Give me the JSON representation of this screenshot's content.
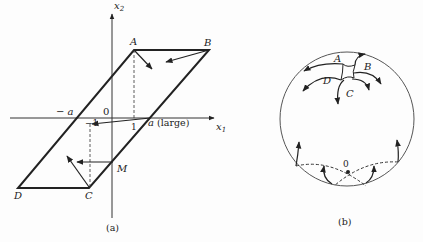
{
  "figure_a": {
    "caption": "(a)",
    "axis_x_label": "x",
    "axis_x_sub": "1",
    "axis_y_label": "x",
    "axis_y_sub": "2",
    "origin_label": "0",
    "neg_a_label": "− a",
    "neg_one_label": "−1",
    "one_label": "1",
    "a_label": "a",
    "a_note": "(large)",
    "points": {
      "A": "A",
      "B": "B",
      "C": "C",
      "D": "D",
      "M": "M"
    }
  },
  "figure_b": {
    "caption": "(b)",
    "origin_label": "0",
    "points": {
      "A": "A",
      "B": "B",
      "C": "C",
      "D": "D"
    }
  },
  "colors": {
    "ink": "#222222",
    "circle": "#555555",
    "background": "#fdfdfd"
  }
}
